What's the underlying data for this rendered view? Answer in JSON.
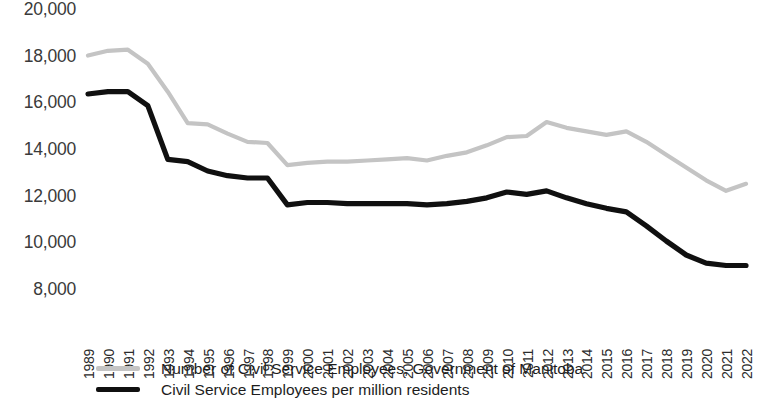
{
  "chart_data": {
    "type": "line",
    "title": "",
    "subtitle": "",
    "xlabel": "",
    "ylabel": "",
    "grid": false,
    "legend_position": "bottom-left",
    "xlim": [
      1989,
      2022
    ],
    "ylim": [
      8000,
      20000
    ],
    "ytick_values": [
      20000,
      18000,
      16000,
      14000,
      12000,
      10000,
      8000
    ],
    "ytick_labels": [
      "20,000",
      "18,000",
      "16,000",
      "14,000",
      "12,000",
      "10,000",
      "8,000"
    ],
    "categories": [
      "1989",
      "1990",
      "1991",
      "1992",
      "1993",
      "1994",
      "1995",
      "1996",
      "1997",
      "1998",
      "1999",
      "2000",
      "2001",
      "2002",
      "2003",
      "2004",
      "2005",
      "2006",
      "2007",
      "2008",
      "2009",
      "2010",
      "2011",
      "2012",
      "2013",
      "2014",
      "2015",
      "2016",
      "2017",
      "2018",
      "2019",
      "2020",
      "2021",
      "2022"
    ],
    "x": [
      1989,
      1990,
      1991,
      1992,
      1993,
      1994,
      1995,
      1996,
      1997,
      1998,
      1999,
      2000,
      2001,
      2002,
      2003,
      2004,
      2005,
      2006,
      2007,
      2008,
      2009,
      2010,
      2011,
      2012,
      2013,
      2014,
      2015,
      2016,
      2017,
      2018,
      2019,
      2020,
      2021,
      2022
    ],
    "series": [
      {
        "name": "Number of Civil Service Employees, Government of Manitoba",
        "color": "#c4c4c4",
        "values": [
          18050,
          18250,
          18300,
          17700,
          16500,
          15150,
          15100,
          14700,
          14350,
          14300,
          13350,
          13450,
          13500,
          13500,
          13550,
          13600,
          13650,
          13550,
          13750,
          13900,
          14200,
          14550,
          14600,
          15200,
          14950,
          14800,
          14650,
          14800,
          14350,
          13800,
          13250,
          12700,
          12250,
          12550
        ]
      },
      {
        "name": "Civil Service Employees per million residents",
        "color": "#101010",
        "values": [
          16400,
          16500,
          16500,
          15900,
          13600,
          13500,
          13100,
          12900,
          12800,
          12800,
          11650,
          11750,
          11750,
          11700,
          11700,
          11700,
          11700,
          11650,
          11700,
          11800,
          11950,
          12200,
          12100,
          12250,
          11950,
          11700,
          11500,
          11350,
          10750,
          10100,
          9500,
          9150,
          9050,
          9050
        ]
      }
    ]
  },
  "legend": {
    "items": [
      {
        "label": "Number of Civil Service Employees, Government of Manitoba",
        "color": "#c4c4c4"
      },
      {
        "label": "Civil Service Employees per million residents",
        "color": "#101010"
      }
    ]
  }
}
